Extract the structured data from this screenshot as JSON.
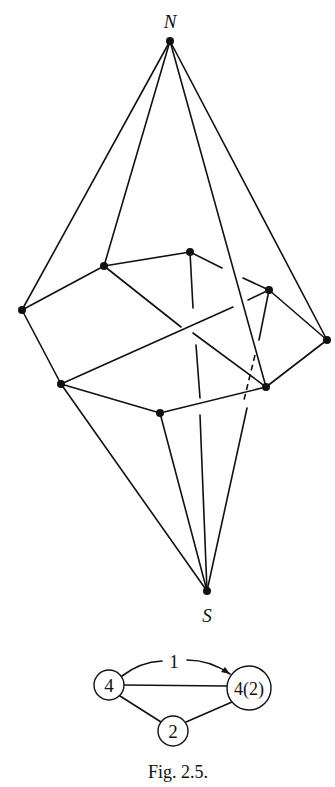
{
  "figure": {
    "caption": "Fig. 2.5.",
    "polyhedron": {
      "pole_labels": {
        "north": "N",
        "south": "S"
      },
      "vertices": {
        "N": [
          170,
          41
        ],
        "S": [
          207,
          591
        ],
        "A": [
          22,
          310
        ],
        "B": [
          104,
          266
        ],
        "C": [
          190,
          252
        ],
        "D": [
          269,
          290
        ],
        "E": [
          327,
          340
        ],
        "F": [
          61,
          384
        ],
        "G": [
          160,
          413
        ],
        "H": [
          266,
          387
        ]
      }
    },
    "graph": {
      "nodes": [
        {
          "id": "left",
          "label": "4"
        },
        {
          "id": "right",
          "label": "4(2)"
        },
        {
          "id": "bottom",
          "label": "2"
        }
      ],
      "arc_label": "1"
    }
  }
}
